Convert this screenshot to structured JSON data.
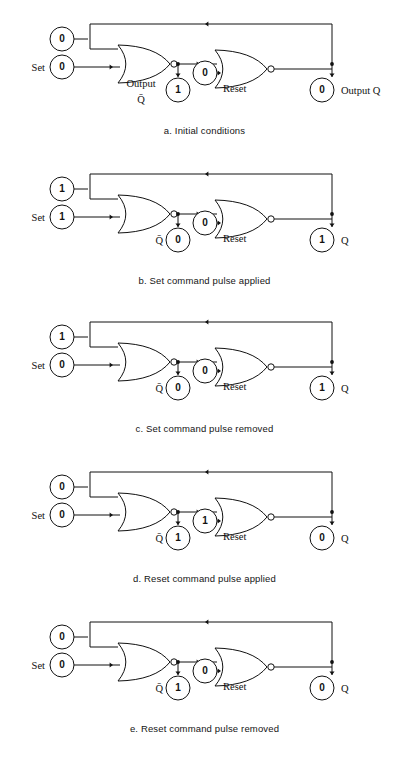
{
  "page": {
    "background": "#ffffff",
    "ink": "#111111"
  },
  "figures": [
    {
      "id": "a",
      "caption": "a. Initial conditions",
      "set_label": "Set",
      "top_input": "0",
      "bottom_input": "0",
      "qbar_value": "1",
      "reset_value": "0",
      "reset_label": "Reset",
      "q_value": "0",
      "qbar_label_style": "two-line-output",
      "qbar_label_line1": "Output",
      "qbar_label_line2": "Q̄",
      "q_label": "Output  Q"
    },
    {
      "id": "b",
      "caption": "b. Set command pulse applied",
      "set_label": "Set",
      "top_input": "1",
      "bottom_input": "1",
      "qbar_value": "0",
      "reset_value": "0",
      "reset_label": "Reset",
      "q_value": "1",
      "qbar_label_style": "inline-qbar",
      "qbar_label_line1": "Q̄",
      "qbar_label_line2": "",
      "q_label": "Q"
    },
    {
      "id": "c",
      "caption": "c. Set command pulse removed",
      "set_label": "Set",
      "top_input": "1",
      "bottom_input": "0",
      "qbar_value": "0",
      "reset_value": "0",
      "reset_label": "Reset",
      "q_value": "1",
      "qbar_label_style": "inline-qbar",
      "qbar_label_line1": "Q̄",
      "qbar_label_line2": "",
      "q_label": "Q"
    },
    {
      "id": "d",
      "caption": "d. Reset command pulse applied",
      "set_label": "Set",
      "top_input": "0",
      "bottom_input": "0",
      "qbar_value": "1",
      "reset_value": "1",
      "reset_label": "Reset",
      "q_value": "0",
      "qbar_label_style": "inline-qbar",
      "qbar_label_line1": "Q̄",
      "qbar_label_line2": "",
      "q_label": "Q"
    },
    {
      "id": "e",
      "caption": "e. Reset command pulse removed",
      "set_label": "Set",
      "top_input": "0",
      "bottom_input": "0",
      "qbar_value": "1",
      "reset_value": "0",
      "reset_label": "Reset",
      "q_value": "0",
      "qbar_label_style": "inline-qbar",
      "qbar_label_line1": "Q̄",
      "qbar_label_line2": "",
      "q_label": "Q"
    }
  ]
}
